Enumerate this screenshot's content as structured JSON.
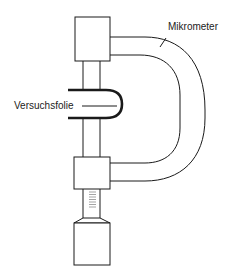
{
  "diagram": {
    "type": "apparatus-schematic",
    "labels": {
      "micrometer": "Mikrometer",
      "test_foil": "Versuchsfolie"
    },
    "colors": {
      "line": "#1a1a1a",
      "background": "#ffffff"
    }
  }
}
